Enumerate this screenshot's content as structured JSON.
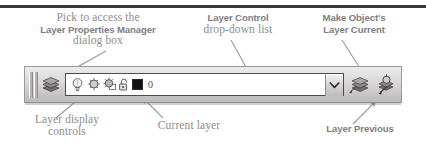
{
  "figure": {
    "annotations": {
      "layer_properties_manager": {
        "line1": "Pick to access the",
        "line2": "Layer Properties Manager",
        "line3": "dialog box"
      },
      "layer_control": {
        "line1": "Layer Control",
        "line2": "drop-down list"
      },
      "make_objects_layer_current": {
        "line1": "Make Object's",
        "line2": "Layer Current"
      },
      "layer_display_controls": {
        "line1": "Layer display",
        "line2": "controls"
      },
      "current_layer": {
        "line1": "Current layer"
      },
      "layer_previous": {
        "line1": "Layer Previous"
      }
    },
    "colors": {
      "annotation_text": "#8d8d8d",
      "annotation_bold_text": "#7e7e80",
      "toolbar_face": "#d9d7d7",
      "toolbar_border": "#9b9999",
      "combo_border": "#4c4a4a",
      "combo_background": "#ffffff",
      "layer_color_swatch": "#111111",
      "top_rule": "#3a3a3c",
      "leader_line": "#9a9a9a"
    }
  },
  "toolbar": {
    "name": "Layers toolbar",
    "grip": {
      "name": "toolbar-drag-grip"
    },
    "buttons": [
      {
        "id": "layer-properties-manager",
        "icon": "layers-stack-icon",
        "tooltip": "Layer Properties Manager"
      },
      {
        "id": "make-objects-layer-current",
        "icon": "layers-stack-arrow-icon",
        "tooltip": "Make Object's Layer Current"
      },
      {
        "id": "layer-previous",
        "icon": "layers-previous-icon",
        "tooltip": "Layer Previous"
      }
    ],
    "layer_control": {
      "name": "Layer Control drop-down list",
      "selected_layer_name": "0",
      "layer_color": "#111111",
      "display_controls": [
        {
          "id": "on-off",
          "icon": "lightbulb-icon",
          "state": "on",
          "tooltip": "On / Off"
        },
        {
          "id": "freeze-thaw",
          "icon": "sun-icon",
          "state": "thawed",
          "tooltip": "Freeze or thaw in ALL viewports"
        },
        {
          "id": "freeze-vp",
          "icon": "sun-rect-icon",
          "state": "thawed",
          "tooltip": "Freeze or thaw in current viewport"
        },
        {
          "id": "lock-unlock",
          "icon": "padlock-open-icon",
          "state": "unlocked",
          "tooltip": "Lock / Unlock"
        }
      ],
      "dropdown_arrow_icon": "chevron-down-icon"
    }
  }
}
